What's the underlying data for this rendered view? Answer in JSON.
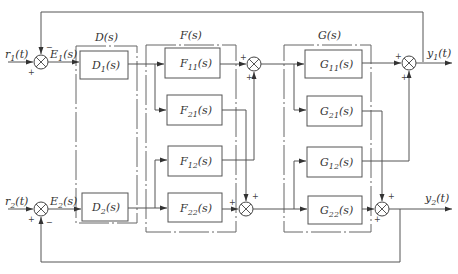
{
  "diagram": {
    "type": "block-diagram",
    "inputs": [
      {
        "id": "r1",
        "label": "r",
        "sub": "1",
        "suffix": "(t)"
      },
      {
        "id": "r2",
        "label": "r",
        "sub": "2",
        "suffix": "(t)"
      }
    ],
    "outputs": [
      {
        "id": "y1",
        "label": "y",
        "sub": "1",
        "suffix": "(t)"
      },
      {
        "id": "y2",
        "label": "y",
        "sub": "2",
        "suffix": "(t)"
      }
    ],
    "errors": [
      {
        "id": "E1",
        "label": "E",
        "sub": "1",
        "suffix": "(s)"
      },
      {
        "id": "E2",
        "label": "E",
        "sub": "2",
        "suffix": "(s)"
      }
    ],
    "groups": [
      {
        "id": "D",
        "label": "D(s)"
      },
      {
        "id": "F",
        "label": "F(s)"
      },
      {
        "id": "G",
        "label": "G(s)"
      }
    ],
    "blocks": {
      "D1": {
        "label": "D",
        "sub": "1",
        "suffix": "(s)"
      },
      "D2": {
        "label": "D",
        "sub": "2",
        "suffix": "(s)"
      },
      "F11": {
        "label": "F",
        "sub": "11",
        "suffix": "(s)"
      },
      "F21": {
        "label": "F",
        "sub": "21",
        "suffix": "(s)"
      },
      "F12": {
        "label": "F",
        "sub": "12",
        "suffix": "(s)"
      },
      "F22": {
        "label": "F",
        "sub": "22",
        "suffix": "(s)"
      },
      "G11": {
        "label": "G",
        "sub": "11",
        "suffix": "(s)"
      },
      "G21": {
        "label": "G",
        "sub": "21",
        "suffix": "(s)"
      },
      "G12": {
        "label": "G",
        "sub": "12",
        "suffix": "(s)"
      },
      "G22": {
        "label": "G",
        "sub": "22",
        "suffix": "(s)"
      }
    },
    "signs": {
      "plus": "+",
      "minus": "−"
    }
  }
}
